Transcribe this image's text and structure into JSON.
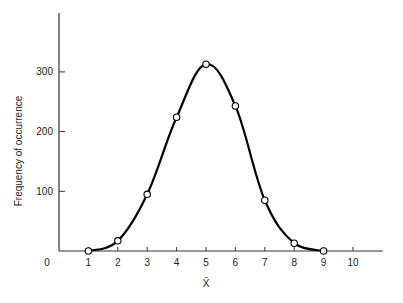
{
  "chart_data": {
    "type": "line",
    "title": "",
    "xlabel": "X̄",
    "ylabel": "Frequency of occurrence",
    "x": [
      1,
      2,
      3,
      4,
      5,
      6,
      7,
      8,
      9
    ],
    "series": [
      {
        "name": "Frequency",
        "values": [
          0,
          17,
          95,
          224,
          313,
          243,
          85,
          13,
          0
        ],
        "marker": "open-circle",
        "smooth": true
      }
    ],
    "xticks": [
      0,
      1,
      2,
      3,
      4,
      5,
      6,
      7,
      8,
      9,
      10
    ],
    "yticks": [
      100,
      200,
      300
    ],
    "xlim": [
      0,
      11
    ],
    "ylim": [
      0,
      400
    ],
    "grid": false,
    "legend": "none"
  },
  "labels": {
    "ylabel": "Frequency of occurrence",
    "xlabel": "X̄",
    "origin": "0"
  },
  "colors": {
    "line": "#000000",
    "axis": "#333333",
    "marker_fill": "#ffffff"
  }
}
